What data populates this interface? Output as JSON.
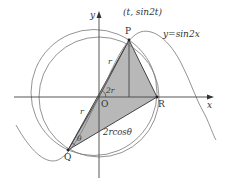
{
  "diagram": {
    "axes": {
      "x_label": "x",
      "y_label": "y",
      "origin_label": "O"
    },
    "points": {
      "P": {
        "label": "P",
        "coord_label": "(t,  sin2t)"
      },
      "Q": {
        "label": "Q"
      },
      "R": {
        "label": "R"
      }
    },
    "curve_label": "y=sin2x",
    "segment_labels": {
      "OP": "r",
      "OQ": "r",
      "QR": "2rcosθ"
    },
    "angle_labels": {
      "POR": "2r",
      "Q": "θ"
    },
    "colors": {
      "fill": "#b4b4b4",
      "stroke": "#555555",
      "text": "#333333"
    }
  }
}
